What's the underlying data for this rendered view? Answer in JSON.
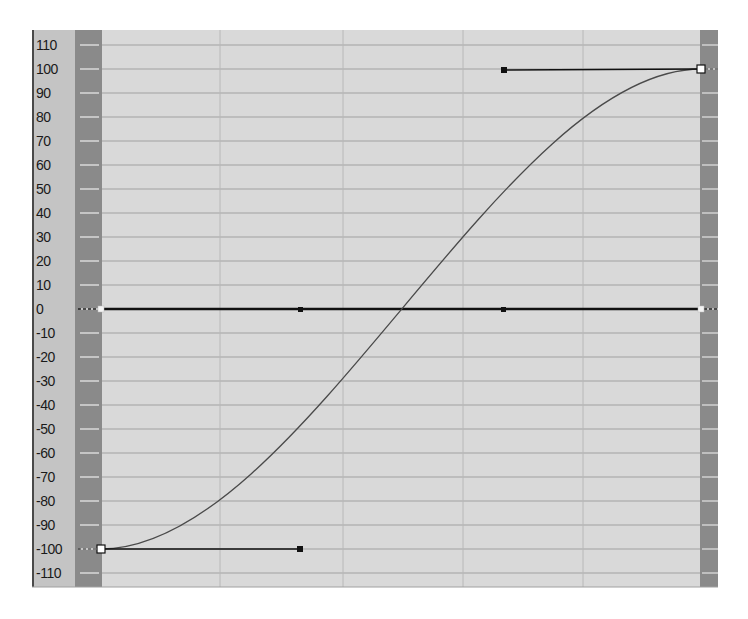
{
  "curve_editor": {
    "value_ruler": {
      "ticks": [
        "110",
        "100",
        "90",
        "80",
        "70",
        "60",
        "50",
        "40",
        "30",
        "20",
        "10",
        "0",
        "-10",
        "-20",
        "-30",
        "-40",
        "-50",
        "-60",
        "-70",
        "-80",
        "-90",
        "-100",
        "-110"
      ]
    },
    "colors": {
      "ruler_bg": "#c4c4c4",
      "out_of_range_band": "#8a8a8a",
      "plot_bg": "#d9d9d9",
      "gridline": "#b3b3b3",
      "curve": "#4a4a4a",
      "flat_curve": "#111111",
      "key_fill": "#ffffff"
    },
    "curves": [
      {
        "name": "ease-curve",
        "start_key": {
          "value": -100
        },
        "end_key": {
          "value": 100
        }
      },
      {
        "name": "flat-curve",
        "start_key": {
          "value": 0
        },
        "end_key": {
          "value": 0
        }
      }
    ]
  },
  "chart_data": {
    "type": "line",
    "title": "",
    "xlabel": "",
    "ylabel": "",
    "ylim": [
      -110,
      110
    ],
    "yticks": [
      110,
      100,
      90,
      80,
      70,
      60,
      50,
      40,
      30,
      20,
      10,
      0,
      -10,
      -20,
      -30,
      -40,
      -50,
      -60,
      -70,
      -80,
      -90,
      -100,
      -110
    ],
    "grid": true,
    "series": [
      {
        "name": "ease-in-out curve",
        "x": [
          0,
          0.2,
          0.4,
          0.5,
          0.6,
          0.8,
          1.0
        ],
        "values": [
          -100,
          -70,
          -20,
          0,
          25,
          75,
          100
        ]
      },
      {
        "name": "flat curve",
        "x": [
          0,
          1.0
        ],
        "values": [
          0,
          0
        ]
      }
    ]
  }
}
